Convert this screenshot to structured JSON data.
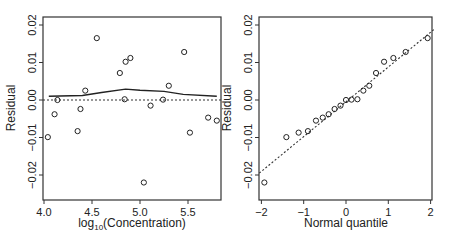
{
  "chart_data": [
    {
      "type": "scatter",
      "title": "",
      "xlabel": "log10(Concentration)",
      "xlabel_main": "log",
      "xlabel_sub": "10",
      "xlabel_rest": "(Concentration)",
      "ylabel": "Residual",
      "xlim": [
        4.0,
        5.82
      ],
      "ylim": [
        -0.026,
        0.022
      ],
      "xticks": [
        4.0,
        4.5,
        5.0,
        5.5
      ],
      "xtick_labels": [
        "4.0",
        "4.5",
        "5.0",
        "5.5"
      ],
      "yticks": [
        0.02,
        0.01,
        0.0,
        -0.01,
        -0.02
      ],
      "ytick_labels": [
        "0.02",
        "0.01",
        "0.00",
        "-0.01",
        "-0.02"
      ],
      "grid": false,
      "reference_line": {
        "y": 0.0,
        "style": "dotted"
      },
      "smooth_line": {
        "x": [
          4.05,
          4.4,
          4.6,
          4.85,
          5.0,
          5.25,
          5.45,
          5.8
        ],
        "y": [
          0.001,
          0.0012,
          0.002,
          0.0029,
          0.0026,
          0.0023,
          0.0015,
          0.001
        ]
      },
      "points": {
        "x": [
          4.04,
          4.11,
          4.14,
          4.35,
          4.38,
          4.43,
          4.55,
          4.79,
          4.84,
          4.85,
          4.9,
          5.04,
          5.11,
          5.24,
          5.3,
          5.46,
          5.52,
          5.71,
          5.8
        ],
        "y": [
          -0.0099,
          -0.0038,
          0.0,
          -0.0083,
          -0.0024,
          0.0025,
          0.0165,
          0.0072,
          0.0002,
          0.0102,
          0.0112,
          -0.022,
          -0.0015,
          0.0001,
          0.0038,
          0.0128,
          -0.0087,
          -0.0047,
          -0.0055
        ]
      }
    },
    {
      "type": "scatter",
      "title": "",
      "xlabel": "Normal quantile",
      "ylabel": "Residual",
      "xlim": [
        -2.05,
        2.05
      ],
      "ylim": [
        -0.026,
        0.022
      ],
      "xticks": [
        -2,
        -1,
        0,
        1,
        2
      ],
      "xtick_labels": [
        "-2",
        "-1",
        "0",
        "1",
        "2"
      ],
      "yticks": [
        0.02,
        0.01,
        0.0,
        -0.01,
        -0.02
      ],
      "ytick_labels": [
        "0.02",
        "0.01",
        "0.00",
        "-0.01",
        "-0.02"
      ],
      "grid": false,
      "reference_line": {
        "x1": -2.05,
        "y1": -0.0195,
        "x2": 2.1,
        "y2": 0.019,
        "style": "dotted"
      },
      "points": {
        "x": [
          -1.93,
          -1.41,
          -1.12,
          -0.9,
          -0.71,
          -0.55,
          -0.41,
          -0.27,
          -0.13,
          0.0,
          0.13,
          0.27,
          0.41,
          0.55,
          0.71,
          0.9,
          1.12,
          1.41,
          1.93
        ],
        "y": [
          -0.022,
          -0.0099,
          -0.0087,
          -0.0083,
          -0.0055,
          -0.0047,
          -0.0038,
          -0.0024,
          -0.0015,
          0.0,
          0.0001,
          0.0002,
          0.0025,
          0.0038,
          0.0072,
          0.0102,
          0.0112,
          0.0128,
          0.0165
        ]
      }
    }
  ]
}
